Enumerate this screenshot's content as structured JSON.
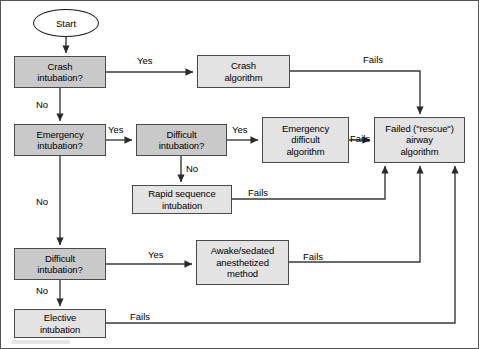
{
  "diagram": {
    "style": {
      "decision_fill": "#c9c9c9",
      "process_fill": "#e3e3e3",
      "line_color": "#333333",
      "border_color": "#4a4a4a",
      "background": "#ffffff"
    },
    "nodes": [
      {
        "id": "start",
        "label": "Start",
        "shape": "terminator",
        "x": 33,
        "y": 9,
        "w": 66,
        "h": 28
      },
      {
        "id": "crash_q",
        "label": "Crash\nintubation?",
        "shape": "decision",
        "x": 14,
        "y": 56,
        "w": 92,
        "h": 32
      },
      {
        "id": "crash_algo",
        "label": "Crash\nalgorithm",
        "shape": "process",
        "x": 197,
        "y": 55,
        "w": 93,
        "h": 33
      },
      {
        "id": "emerg_q",
        "label": "Emergency\nintubation?",
        "shape": "decision",
        "x": 14,
        "y": 124,
        "w": 92,
        "h": 32
      },
      {
        "id": "diff_q1",
        "label": "Difficult\nintubation?",
        "shape": "decision",
        "x": 136,
        "y": 124,
        "w": 91,
        "h": 32
      },
      {
        "id": "emerg_diff",
        "label": "Emergency\ndifficult\nalgorithm",
        "shape": "process",
        "x": 262,
        "y": 117,
        "w": 87,
        "h": 46
      },
      {
        "id": "failed",
        "label": "Failed (\"rescue\")\nairway\nalgorithm",
        "shape": "process",
        "x": 374,
        "y": 117,
        "w": 91,
        "h": 46
      },
      {
        "id": "rapid_seq",
        "label": "Rapid sequence\nintubation",
        "shape": "process",
        "x": 132,
        "y": 185,
        "w": 100,
        "h": 29
      },
      {
        "id": "diff_q2",
        "label": "Difficult\nintubation?",
        "shape": "decision",
        "x": 14,
        "y": 248,
        "w": 92,
        "h": 32
      },
      {
        "id": "awake",
        "label": "Awake/sedated\nanesthetized\nmethod",
        "shape": "process",
        "x": 196,
        "y": 240,
        "w": 93,
        "h": 45
      },
      {
        "id": "elective",
        "label": "Elective\nintubation",
        "shape": "process",
        "x": 14,
        "y": 309,
        "w": 92,
        "h": 29
      }
    ],
    "edges": [
      {
        "id": "e-start-crash",
        "from": "start",
        "to": "crash_q",
        "label": ""
      },
      {
        "id": "e-crash-yes",
        "from": "crash_q",
        "to": "crash_algo",
        "label": "Yes"
      },
      {
        "id": "e-crash-no",
        "from": "crash_q",
        "to": "emerg_q",
        "label": "No"
      },
      {
        "id": "e-crashalgo-fails",
        "from": "crash_algo",
        "to": "failed",
        "label": "Fails"
      },
      {
        "id": "e-emerg-yes",
        "from": "emerg_q",
        "to": "diff_q1",
        "label": "Yes"
      },
      {
        "id": "e-emerg-no",
        "from": "emerg_q",
        "to": "diff_q2",
        "label": "No"
      },
      {
        "id": "e-diff1-yes",
        "from": "diff_q1",
        "to": "emerg_diff",
        "label": "Yes"
      },
      {
        "id": "e-diff1-no",
        "from": "diff_q1",
        "to": "rapid_seq",
        "label": "No"
      },
      {
        "id": "e-emergdiff-fails",
        "from": "emerg_diff",
        "to": "failed",
        "label": "Fails"
      },
      {
        "id": "e-rapid-fails",
        "from": "rapid_seq",
        "to": "failed",
        "label": "Fails"
      },
      {
        "id": "e-diff2-yes",
        "from": "diff_q2",
        "to": "awake",
        "label": "Yes"
      },
      {
        "id": "e-diff2-no",
        "from": "diff_q2",
        "to": "elective",
        "label": "No"
      },
      {
        "id": "e-awake-fails",
        "from": "awake",
        "to": "failed",
        "label": "Fails"
      },
      {
        "id": "e-elective-fails",
        "from": "elective",
        "to": "failed",
        "label": "Fails"
      }
    ],
    "edge_labels": [
      {
        "id": "lbl-crash-yes",
        "text": "Yes",
        "x": 137,
        "y": 55
      },
      {
        "id": "lbl-crash-no",
        "text": "No",
        "x": 36,
        "y": 99
      },
      {
        "id": "lbl-crashalgo",
        "text": "Fails",
        "x": 363,
        "y": 55
      },
      {
        "id": "lbl-emerg-yes",
        "text": "Yes",
        "x": 108,
        "y": 124
      },
      {
        "id": "lbl-emerg-no",
        "text": "No",
        "x": 36,
        "y": 196
      },
      {
        "id": "lbl-diff1-yes",
        "text": "Yes",
        "x": 232,
        "y": 124
      },
      {
        "id": "lbl-diff1-no",
        "text": "No",
        "x": 187,
        "y": 163
      },
      {
        "id": "lbl-emergdiff",
        "text": "Fails",
        "x": 349,
        "y": 133
      },
      {
        "id": "lbl-rapid",
        "text": "Fails",
        "x": 248,
        "y": 185
      },
      {
        "id": "lbl-diff2-yes",
        "text": "Yes",
        "x": 148,
        "y": 248
      },
      {
        "id": "lbl-diff2-no",
        "text": "No",
        "x": 36,
        "y": 285
      },
      {
        "id": "lbl-awake",
        "text": "Fails",
        "x": 303,
        "y": 262
      },
      {
        "id": "lbl-elective",
        "text": "Fails",
        "x": 130,
        "y": 309
      }
    ]
  }
}
